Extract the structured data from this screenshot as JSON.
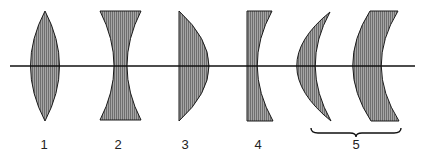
{
  "diagram": {
    "colors": {
      "fill": "#8c8c8c",
      "stroke": "#1a1a1a",
      "axis": "#111111",
      "background": "#ffffff"
    },
    "optical_axis": {
      "y": 66,
      "x_start": 10,
      "x_end": 415
    },
    "lenses": [
      {
        "id": 1,
        "type": "biconvex",
        "label": "1"
      },
      {
        "id": 2,
        "type": "biconcave",
        "label": "2"
      },
      {
        "id": 3,
        "type": "plano-convex",
        "label": "3"
      },
      {
        "id": 4,
        "type": "plano-concave",
        "label": "4"
      },
      {
        "id": 5,
        "type": "meniscus-convex",
        "label": "5"
      },
      {
        "id": 6,
        "type": "meniscus-concave",
        "label": "5"
      }
    ],
    "labels": [
      "1",
      "2",
      "3",
      "4",
      "5"
    ],
    "group_brace": {
      "label": "5",
      "spans": [
        "meniscus-convex",
        "meniscus-concave"
      ]
    }
  }
}
